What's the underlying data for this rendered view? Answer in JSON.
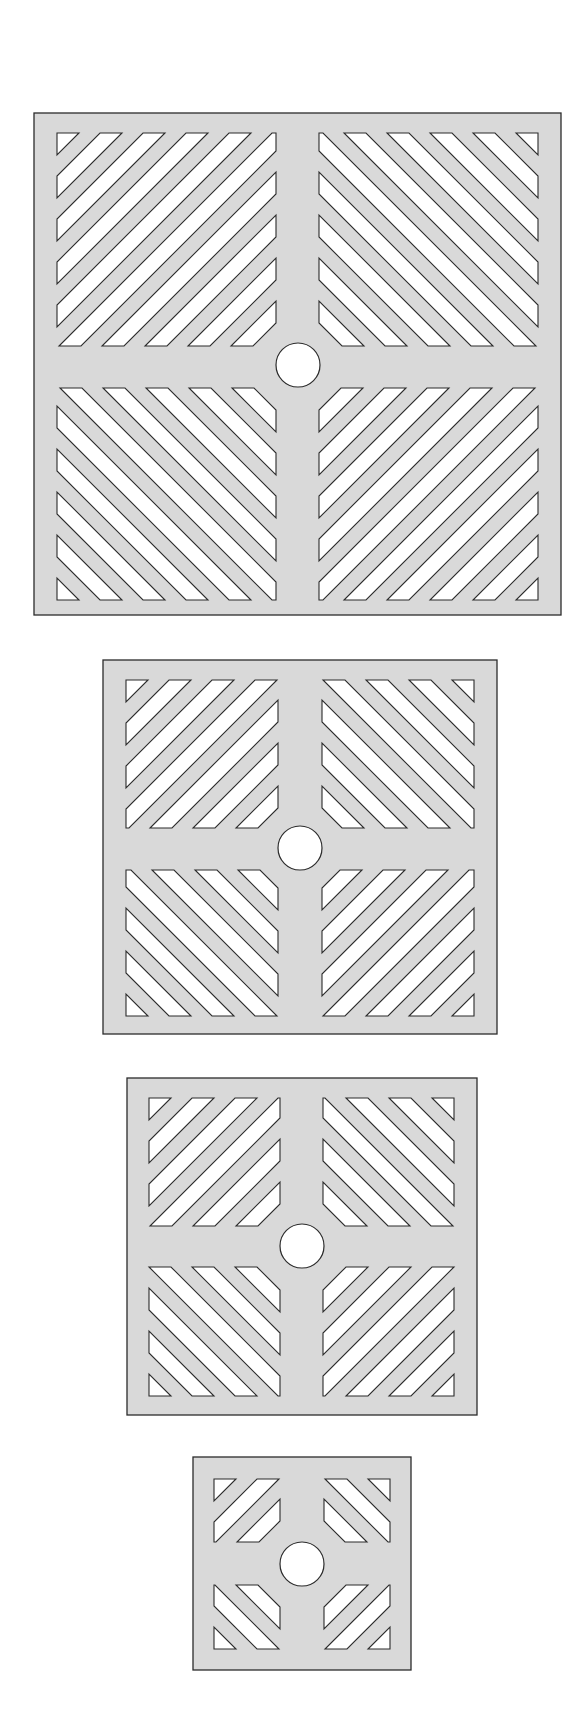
{
  "figure": {
    "width": 584,
    "height": 1722,
    "colors": {
      "background": "#ffffff",
      "plate_fill": "#d9d9d9",
      "slot_fill": "#ffffff",
      "outline": "#2b2b2b"
    },
    "slot_pattern": {
      "period": 43,
      "slot_width": 22
    },
    "panels": [
      {
        "name": "grille-large",
        "box": [
          34,
          113,
          561,
          615
        ],
        "quadrants_x": [
          [
            57,
            276
          ],
          [
            319,
            538
          ]
        ],
        "quadrants_y": [
          [
            133,
            346
          ],
          [
            388,
            600
          ]
        ],
        "bands": 10,
        "hole": {
          "cx": 298,
          "cy": 365,
          "r": 22
        }
      },
      {
        "name": "grille-medium",
        "box": [
          103,
          660,
          497,
          1034
        ],
        "quadrants_x": [
          [
            126,
            278
          ],
          [
            322,
            474
          ]
        ],
        "quadrants_y": [
          [
            680,
            828
          ],
          [
            870,
            1016
          ]
        ],
        "bands": 7,
        "hole": {
          "cx": 300,
          "cy": 848,
          "r": 22
        }
      },
      {
        "name": "grille-small",
        "box": [
          127,
          1078,
          477,
          1415
        ],
        "quadrants_x": [
          [
            149,
            280
          ],
          [
            323,
            454
          ]
        ],
        "quadrants_y": [
          [
            1098,
            1226
          ],
          [
            1267,
            1396
          ]
        ],
        "bands": 6,
        "hole": {
          "cx": 302,
          "cy": 1246,
          "r": 22
        }
      },
      {
        "name": "grille-smallest",
        "box": [
          193,
          1457,
          411,
          1670
        ],
        "quadrants_x": [
          [
            214,
            280
          ],
          [
            324,
            390
          ]
        ],
        "quadrants_y": [
          [
            1479,
            1542
          ],
          [
            1585,
            1649
          ]
        ],
        "bands": 3,
        "hole": {
          "cx": 302,
          "cy": 1564,
          "r": 22
        }
      }
    ]
  }
}
